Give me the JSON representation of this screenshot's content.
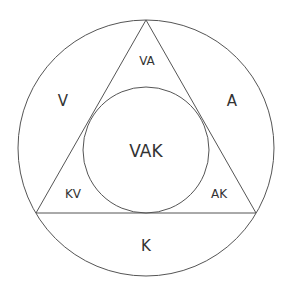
{
  "diagram": {
    "type": "venn-like circle-triangle-circle",
    "colors": {
      "stroke": "#555555",
      "text": "#333333",
      "background": "#ffffff"
    },
    "regions": {
      "v": "V",
      "a": "A",
      "k": "K",
      "va": "VA",
      "kv": "KV",
      "ak": "AK",
      "vak": "VAK"
    }
  }
}
